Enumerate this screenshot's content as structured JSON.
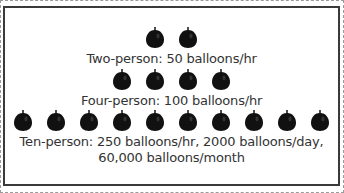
{
  "diagram": {
    "rows": [
      {
        "name": "two-person",
        "balloon_count": 2,
        "label": "Two-person: 50 balloons/hr"
      },
      {
        "name": "four-person",
        "balloon_count": 4,
        "label": "Four-person: 100 balloons/hr"
      },
      {
        "name": "ten-person",
        "balloon_count": 10,
        "label_line1": "Ten-person: 250 balloons/hr, 2000 balloons/day,",
        "label_line2": "60,000 balloons/month"
      }
    ],
    "balloon_icon": "balloon-icon",
    "balloon_color": "#111111"
  }
}
